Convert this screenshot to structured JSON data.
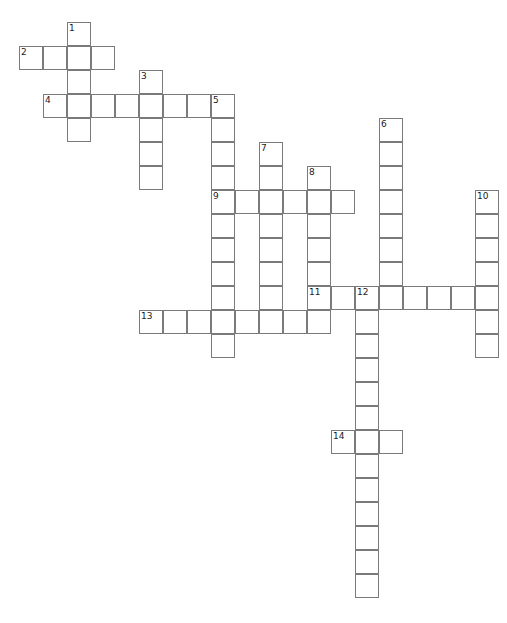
{
  "puzzle": {
    "title": "Crossword Grid",
    "cell_size": 24,
    "origin_x": 19,
    "origin_y": 22,
    "columns": 21,
    "rows": 25,
    "border_color": "#7b7b7b",
    "cell_fill": "#ffffff",
    "page_background": "#ffffff",
    "number_color": "#1a1a1a",
    "number_font_size": 9
  },
  "entries": [
    {
      "number": "1",
      "direction": "down",
      "col": 2,
      "row": 0,
      "length": 5
    },
    {
      "number": "2",
      "direction": "across",
      "col": 0,
      "row": 1,
      "length": 4
    },
    {
      "number": "3",
      "direction": "down",
      "col": 5,
      "row": 2,
      "length": 5
    },
    {
      "number": "4",
      "direction": "across",
      "col": 1,
      "row": 3,
      "length": 8
    },
    {
      "number": "5",
      "direction": "down",
      "col": 8,
      "row": 3,
      "length": 11
    },
    {
      "number": "6",
      "direction": "down",
      "col": 15,
      "row": 4,
      "length": 8
    },
    {
      "number": "7",
      "direction": "down",
      "col": 10,
      "row": 5,
      "length": 8
    },
    {
      "number": "8",
      "direction": "down",
      "col": 12,
      "row": 6,
      "length": 7
    },
    {
      "number": "9",
      "direction": "across",
      "col": 8,
      "row": 7,
      "length": 6
    },
    {
      "number": "10",
      "direction": "down",
      "col": 19,
      "row": 7,
      "length": 7
    },
    {
      "number": "11",
      "direction": "across",
      "col": 12,
      "row": 11,
      "length": 8
    },
    {
      "number": "12",
      "direction": "down",
      "col": 14,
      "row": 11,
      "length": 13
    },
    {
      "number": "13",
      "direction": "across",
      "col": 5,
      "row": 12,
      "length": 7
    },
    {
      "number": "14",
      "direction": "across",
      "col": 13,
      "row": 17,
      "length": 3
    }
  ],
  "letters": []
}
